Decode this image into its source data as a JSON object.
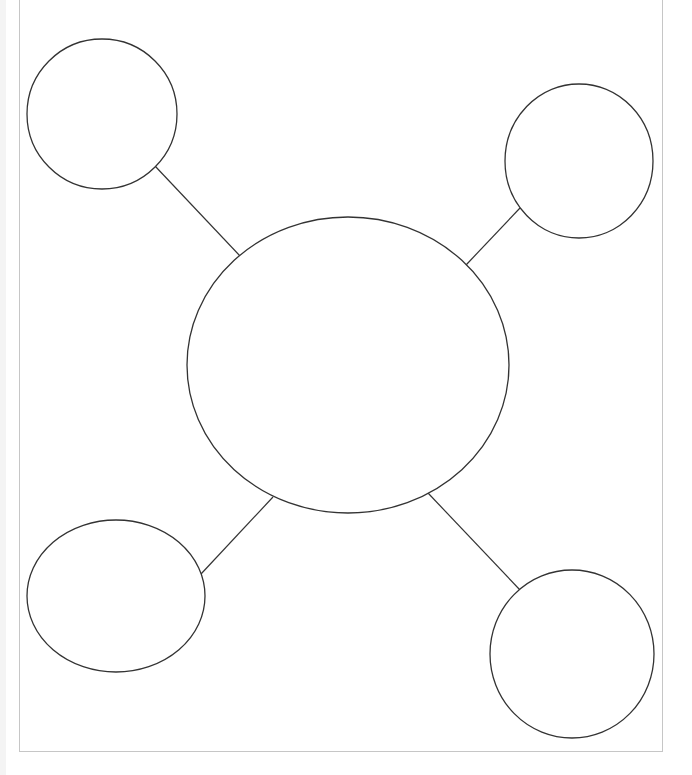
{
  "diagram": {
    "type": "bubble-map",
    "caption_clipped": "",
    "stroke_color": "#333333",
    "frame_color": "#c6c6c6",
    "center_node": {
      "cx": 348,
      "cy": 365,
      "rx": 161,
      "ry": 148,
      "label": ""
    },
    "outer_nodes": [
      {
        "id": "top-left",
        "cx": 102,
        "cy": 114,
        "rx": 75,
        "ry": 75,
        "label": ""
      },
      {
        "id": "top-right",
        "cx": 579,
        "cy": 161,
        "rx": 74,
        "ry": 77,
        "label": ""
      },
      {
        "id": "bottom-left",
        "cx": 116,
        "cy": 596,
        "rx": 89,
        "ry": 76,
        "label": ""
      },
      {
        "id": "bottom-right",
        "cx": 572,
        "cy": 654,
        "rx": 82,
        "ry": 84,
        "label": ""
      }
    ],
    "connectors": [
      {
        "id": "top-left",
        "x1": 155,
        "y1": 166,
        "x2": 240,
        "y2": 256
      },
      {
        "id": "top-right",
        "x1": 520,
        "y1": 208,
        "x2": 466,
        "y2": 265
      },
      {
        "id": "bottom-left",
        "x1": 273,
        "y1": 497,
        "x2": 201,
        "y2": 574
      },
      {
        "id": "bottom-right",
        "x1": 428,
        "y1": 493,
        "x2": 520,
        "y2": 590
      }
    ]
  }
}
